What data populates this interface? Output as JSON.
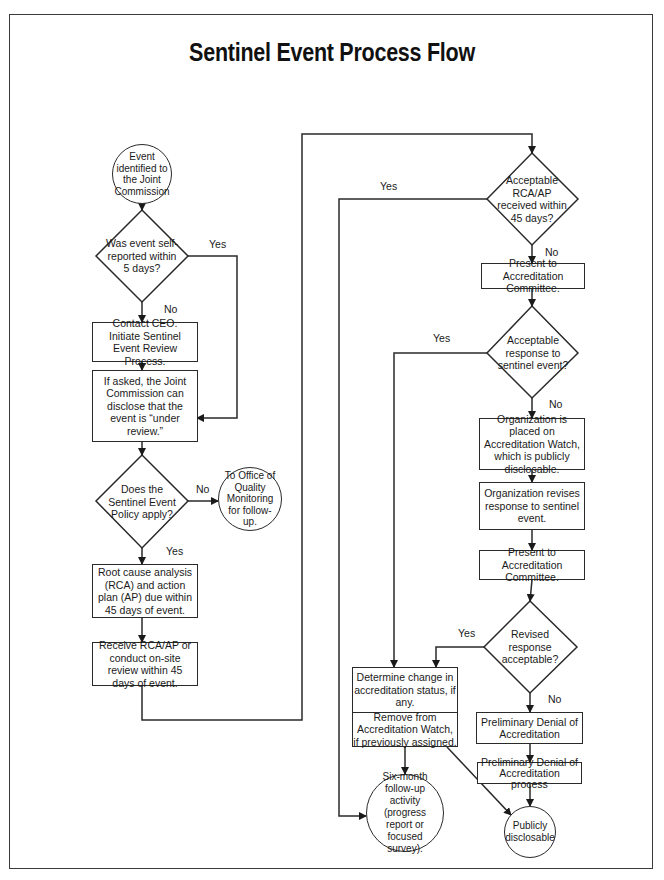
{
  "title": "Sentinel Event Process Flow",
  "nodes": {
    "start": "Event identified to the Joint Commission",
    "d_self_reported": "Was event self-reported within 5 days?",
    "contact_ceo": "Contact CEO. Initiate Sentinel Event Review Process.",
    "if_asked": "If asked, the Joint Commission can disclose that the event is “under review.”",
    "d_policy_apply": "Does the Sentinel Event Policy apply?",
    "office_quality": "To Office of Quality Monitoring for follow-up.",
    "rca_due": "Root cause analysis (RCA) and action plan (AP) due within 45 days of event.",
    "receive_rca": "Receive RCA/AP or conduct on-site review within 45 days of event.",
    "d_rca_acceptable": "Acceptable RCA/AP received within 45 days?",
    "present_committee_1": "Present to Accreditation Committee.",
    "d_response_acceptable": "Acceptable response to sentinel event?",
    "accreditation_watch": "Organization is placed on Accreditation Watch, which is publicly disclosable.",
    "org_revises": "Organization revises response to sentinel event.",
    "present_committee_2": "Present to Accreditation Committee.",
    "d_revised_acceptable": "Revised response acceptable?",
    "determine_change": "Determine change in accreditation status, if any.",
    "remove_watch": "Remove from Accreditation Watch, if previously assigned.",
    "prelim_denial": "Preliminary Denial of Accreditation",
    "prelim_denial_process": "Preliminary Denial of Accreditation process",
    "six_month": "Six-month follow-up activity (progress report or focused survey).",
    "publicly_disclosable": "Publicly disclosable"
  },
  "labels": {
    "yes": "Yes",
    "no": "No"
  },
  "colors": {
    "stroke": "#2a2a2a",
    "text": "#1a1a1a",
    "background": "#ffffff"
  }
}
